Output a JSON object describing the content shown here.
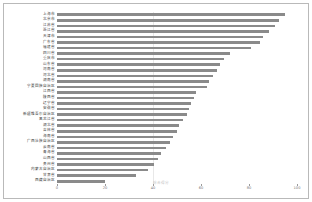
{
  "chart_data": {
    "type": "bar",
    "orientation": "horizontal",
    "title": "",
    "xlabel": "综合得分",
    "ylabel": "",
    "xlim": [
      0,
      100
    ],
    "xticks": [
      0,
      20,
      40,
      60,
      80,
      100
    ],
    "xtick_labels": [
      "0",
      "20",
      "40",
      "60",
      "80",
      "100"
    ],
    "grid": true,
    "gridlines_at": [
      40
    ],
    "legend": null,
    "bar_color": "#8a8a8a",
    "sorted": "descending",
    "categories": [
      "上海市",
      "北京市",
      "江苏省",
      "浙江省",
      "天津市",
      "广东省",
      "福建省",
      "四川省",
      "重庆市",
      "山东省",
      "河南省",
      "河北省",
      "湖南省",
      "宁夏回族自治区",
      "江西省",
      "陕西省",
      "辽宁省",
      "安徽省",
      "新疆维吾尔自治区",
      "黑龙江省",
      "湖北省",
      "吉林省",
      "海南省",
      "广西壮族自治区",
      "云南省",
      "青海省",
      "山西省",
      "贵州省",
      "内蒙古自治区",
      "甘肃省",
      "西藏自治区"
    ],
    "values": [
      95.0,
      92.5,
      91.0,
      88.5,
      86.0,
      84.5,
      81.0,
      72.0,
      69.5,
      68.0,
      66.5,
      65.0,
      63.5,
      62.5,
      58.0,
      57.0,
      56.0,
      55.0,
      54.0,
      52.5,
      51.0,
      50.0,
      48.5,
      47.0,
      45.5,
      43.5,
      42.0,
      40.5,
      38.0,
      33.0,
      20.0
    ]
  }
}
